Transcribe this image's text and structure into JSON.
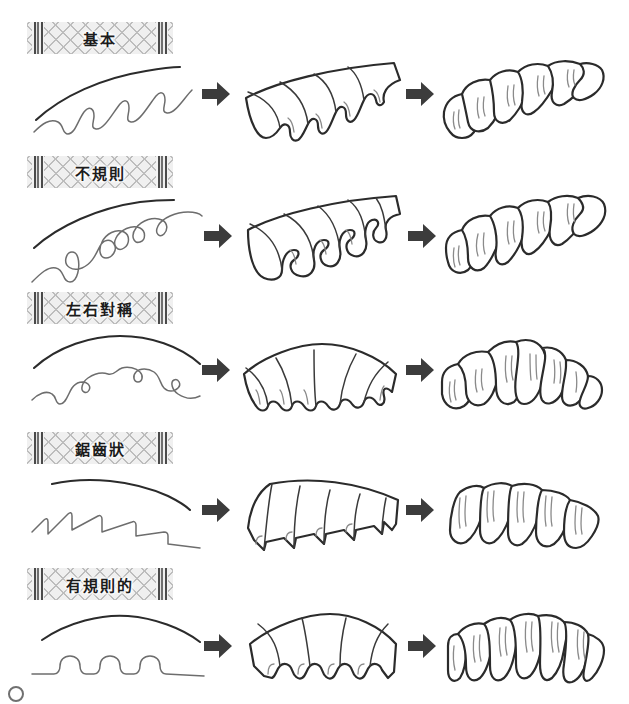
{
  "page": {
    "width": 629,
    "height": 704,
    "background": "#ffffff",
    "ink_color": "#2b2b2b",
    "arrow_color": "#3c3c3c",
    "ribbon_color": "#eeeeee",
    "ribbon_weave_color": "#bdbdbd"
  },
  "columns": [
    {
      "name": "cut-line-sketch",
      "caption": ""
    },
    {
      "name": "flat-pleat-form",
      "caption": ""
    },
    {
      "name": "finished-ruffle-form",
      "caption": ""
    }
  ],
  "arrow": {
    "name": "arrow-right-icon",
    "glyph": "➡"
  },
  "rows": [
    {
      "id": "kihon",
      "label": "基本",
      "label_name": "label-kihon",
      "top": 18,
      "edge_profile": "wave",
      "teeth": 4,
      "symmetry": "asymmetric",
      "baseline": "diagonal-rising"
    },
    {
      "id": "fukisoku",
      "label": "不規則",
      "label_name": "label-fukisoku",
      "top": 155,
      "edge_profile": "loopy-curl",
      "teeth": 4,
      "symmetry": "irregular",
      "baseline": "diagonal-rising"
    },
    {
      "id": "sayutaisho",
      "label": "左右對稱",
      "label_name": "label-sayutaisho",
      "top": 293,
      "edge_profile": "mirrored-wave",
      "teeth": 5,
      "symmetry": "bilateral",
      "baseline": "arched"
    },
    {
      "id": "kyoshijo",
      "label": "鋸齒狀",
      "label_name": "label-kyoshijo",
      "top": 432,
      "edge_profile": "sawtooth",
      "teeth": 5,
      "symmetry": "asymmetric",
      "baseline": "diagonal-falling"
    },
    {
      "id": "yukisokuteki",
      "label": "有規則的",
      "label_name": "label-yukisokuteki",
      "top": 568,
      "edge_profile": "regular-scallop",
      "teeth": 4,
      "symmetry": "regular",
      "baseline": "arched"
    }
  ],
  "footnote": {
    "marker": "○",
    "text": ""
  }
}
